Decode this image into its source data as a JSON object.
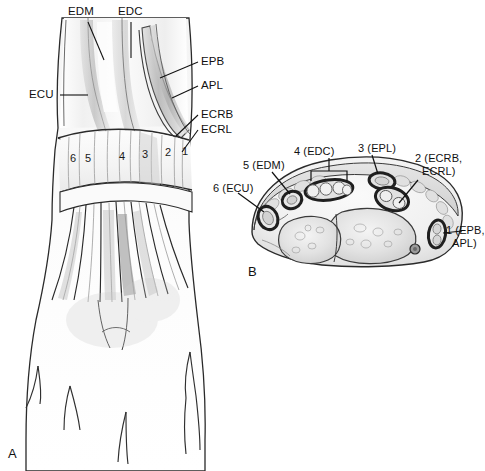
{
  "figure": {
    "background_color": "#ffffff",
    "ink_color": "#1a1a1a",
    "panels": [
      {
        "letter": "A",
        "name": "dorsal-wrist-hand-view"
      },
      {
        "letter": "B",
        "name": "wrist-cross-section-view"
      }
    ]
  },
  "panel_a": {
    "letter": "A",
    "labels": [
      {
        "id": "edm",
        "text": "EDM"
      },
      {
        "id": "edc",
        "text": "EDC"
      },
      {
        "id": "ecu",
        "text": "ECU"
      },
      {
        "id": "epb",
        "text": "EPB"
      },
      {
        "id": "apl",
        "text": "APL"
      },
      {
        "id": "ecrb",
        "text": "ECRB"
      },
      {
        "id": "ecrl",
        "text": "ECRL"
      }
    ],
    "compartment_numbers": [
      "6",
      "5",
      "4",
      "3",
      "2",
      "1"
    ]
  },
  "panel_b": {
    "letter": "B",
    "labels": [
      {
        "id": "comp6",
        "text": "6 (ECU)"
      },
      {
        "id": "comp5",
        "text": "5 (EDM)"
      },
      {
        "id": "comp4",
        "text": "4 (EDC)"
      },
      {
        "id": "comp3",
        "text": "3 (EPL)"
      },
      {
        "id": "comp2-line1",
        "text": "2 (ECRB,"
      },
      {
        "id": "comp2-line2",
        "text": "ECRL)"
      },
      {
        "id": "comp1-line1",
        "text": "1 (EPB,"
      },
      {
        "id": "comp1-line2",
        "text": "APL)"
      }
    ]
  }
}
